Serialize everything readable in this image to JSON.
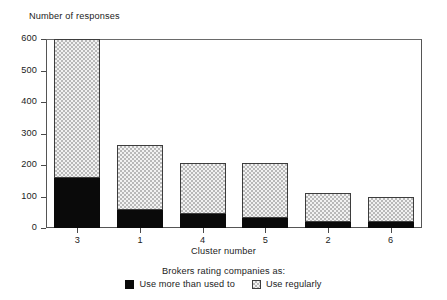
{
  "chart_data": {
    "type": "bar",
    "subtype": "stacked-vertical",
    "title": "",
    "ylabel": "Number of responses",
    "xlabel": "Cluster number",
    "categories": [
      "3",
      "1",
      "4",
      "5",
      "2",
      "6"
    ],
    "ylim": [
      0,
      600
    ],
    "ytick_labels": [
      "0",
      "100",
      "200",
      "300",
      "400",
      "500",
      "600"
    ],
    "ytick_values": [
      0,
      100,
      200,
      300,
      400,
      500,
      600
    ],
    "grid": false,
    "legend_position": "bottom-center",
    "legend_title": "Brokers rating companies as:",
    "series": [
      {
        "name": "Use more than used to",
        "fill": "solid-black",
        "color": "#0a0a0a",
        "values": [
          160,
          57,
          45,
          32,
          20,
          18
        ]
      },
      {
        "name": "Use regularly",
        "fill": "checkered",
        "color": "#f2f2f2",
        "values": [
          440,
          205,
          160,
          173,
          90,
          80
        ]
      }
    ],
    "totals": [
      600,
      262,
      205,
      205,
      110,
      98
    ]
  },
  "legend": {
    "title": "Brokers rating companies as:",
    "items": [
      {
        "label": "Use more than used to",
        "swatch": "solid-black-swatch"
      },
      {
        "label": "Use regularly",
        "swatch": "checkered-swatch"
      }
    ]
  }
}
